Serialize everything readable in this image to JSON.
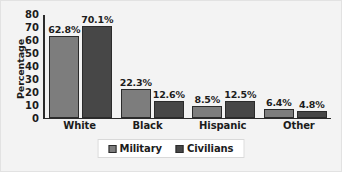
{
  "chart_data": {
    "type": "bar",
    "title": "",
    "xlabel": "",
    "ylabel": "Percentage",
    "ylim": [
      0,
      80
    ],
    "yticks": [
      80,
      70,
      60,
      50,
      40,
      30,
      20,
      10,
      0
    ],
    "grid": false,
    "legend_position": "bottom-center",
    "categories": [
      "White",
      "Black",
      "Hispanic",
      "Other"
    ],
    "series": [
      {
        "name": "Military",
        "color": "#7d7d7d",
        "values": [
          62.8,
          22.3,
          8.5,
          6.4
        ],
        "labels": [
          "62.8%",
          "22.3%",
          "8.5%",
          "6.4%"
        ]
      },
      {
        "name": "Civilians",
        "color": "#474747",
        "values": [
          70.1,
          12.6,
          12.5,
          4.8
        ],
        "labels": [
          "70.1%",
          "12.6%",
          "12.5%",
          "4.8%"
        ]
      }
    ]
  },
  "legend": {
    "items": [
      {
        "label": "Military",
        "swatch": "military-swatch"
      },
      {
        "label": "Civilians",
        "swatch": "civilians-swatch"
      }
    ]
  }
}
